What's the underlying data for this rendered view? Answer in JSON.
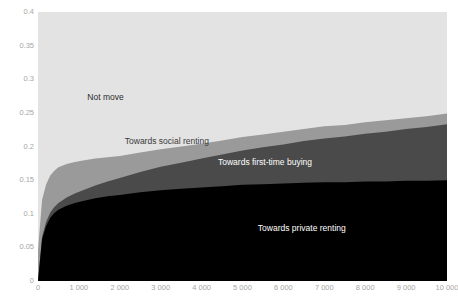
{
  "chart_data": {
    "type": "area",
    "title": "",
    "subtitle": "",
    "xlabel": "",
    "ylabel": "",
    "stacked": true,
    "grid": false,
    "legend_position": "in-plot-labels",
    "xlim": [
      0,
      10000
    ],
    "ylim": [
      0,
      0.4
    ],
    "xticks": [
      0,
      1000,
      2000,
      3000,
      4000,
      5000,
      6000,
      7000,
      8000,
      9000,
      10000
    ],
    "xticklabels": [
      "0",
      "1 000",
      "2 000",
      "3 000",
      "4 000",
      "5 000",
      "6 000",
      "7 000",
      "8 000",
      "9 000",
      "10 000"
    ],
    "yticks": [
      0,
      0.05,
      0.1,
      0.15,
      0.2,
      0.25,
      0.3,
      0.35,
      0.4
    ],
    "yticklabels": [
      "0",
      "0.05",
      "0.1",
      "0.15",
      "0.2",
      "0.25",
      "0.3",
      "0.35",
      "0.4"
    ],
    "x": [
      0,
      100,
      200,
      300,
      400,
      500,
      700,
      900,
      1100,
      1400,
      1700,
      2000,
      2500,
      3000,
      3500,
      4000,
      4500,
      5000,
      5500,
      6000,
      6500,
      7000,
      7500,
      8000,
      8500,
      9000,
      9500,
      10000
    ],
    "series": [
      {
        "name": "Towards private renting",
        "color": "#000000",
        "label": "Towards private renting",
        "label_color": "#ffffff",
        "values": [
          0.0,
          0.062,
          0.082,
          0.094,
          0.101,
          0.106,
          0.112,
          0.116,
          0.119,
          0.123,
          0.126,
          0.128,
          0.132,
          0.135,
          0.137,
          0.139,
          0.141,
          0.143,
          0.144,
          0.145,
          0.146,
          0.147,
          0.147,
          0.148,
          0.148,
          0.149,
          0.149,
          0.15
        ]
      },
      {
        "name": "Towards first-time buying",
        "color": "#4a4a4a",
        "label": "Towards first-time buying",
        "label_color": "#ffffff",
        "values": [
          0.0,
          0.004,
          0.006,
          0.008,
          0.009,
          0.01,
          0.012,
          0.014,
          0.016,
          0.019,
          0.022,
          0.025,
          0.03,
          0.035,
          0.039,
          0.043,
          0.047,
          0.051,
          0.055,
          0.058,
          0.062,
          0.065,
          0.068,
          0.071,
          0.074,
          0.077,
          0.08,
          0.083
        ]
      },
      {
        "name": "Towards social renting",
        "color": "#9a9a9a",
        "label": "Towards social renting",
        "label_color": "#3a3a3a",
        "values": [
          0.046,
          0.055,
          0.056,
          0.055,
          0.054,
          0.053,
          0.05,
          0.047,
          0.044,
          0.04,
          0.036,
          0.033,
          0.029,
          0.026,
          0.024,
          0.022,
          0.021,
          0.02,
          0.019,
          0.019,
          0.018,
          0.018,
          0.017,
          0.017,
          0.017,
          0.016,
          0.016,
          0.016
        ]
      },
      {
        "name": "Not move",
        "color": "#e3e3e3",
        "label": "Not move",
        "label_color": "#2b2b2b",
        "values": [
          0.354,
          0.279,
          0.256,
          0.243,
          0.236,
          0.231,
          0.226,
          0.223,
          0.221,
          0.218,
          0.216,
          0.214,
          0.209,
          0.204,
          0.2,
          0.196,
          0.191,
          0.186,
          0.182,
          0.178,
          0.174,
          0.17,
          0.168,
          0.164,
          0.161,
          0.158,
          0.155,
          0.151
        ]
      }
    ],
    "annotations": [
      {
        "text": "Not move",
        "x": 1650,
        "y": 0.272
      },
      {
        "text": "Towards social renting",
        "x": 3150,
        "y": 0.207
      },
      {
        "text": "Towards first-time buying",
        "x": 5550,
        "y": 0.176
      },
      {
        "text": "Towards private renting",
        "x": 6450,
        "y": 0.078
      }
    ]
  },
  "axis": {
    "tick_color": "#a6a6a6",
    "plot_background": "#e3e3e3",
    "page_background": "#ffffff"
  }
}
